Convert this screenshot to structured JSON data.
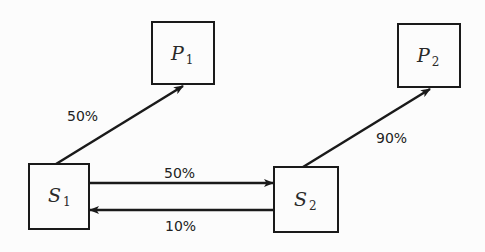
{
  "diagram": {
    "nodes": [
      {
        "id": "S1",
        "base": "S",
        "sub": "1"
      },
      {
        "id": "S2",
        "base": "S",
        "sub": "2"
      },
      {
        "id": "P1",
        "base": "P",
        "sub": "1"
      },
      {
        "id": "P2",
        "base": "P",
        "sub": "2"
      }
    ],
    "edges": [
      {
        "from": "S1",
        "to": "P1",
        "label": "50%"
      },
      {
        "from": "S1",
        "to": "S2",
        "label": "50%"
      },
      {
        "from": "S2",
        "to": "S1",
        "label": "10%"
      },
      {
        "from": "S2",
        "to": "P2",
        "label": "90%"
      }
    ],
    "colors": {
      "stroke": "#1a1a1a",
      "background": "#fcfcfc"
    }
  }
}
